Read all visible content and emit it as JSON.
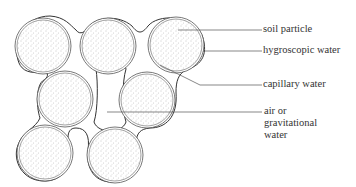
{
  "diagram": {
    "labels": [
      {
        "id": "soil-particle",
        "text": "soil particle",
        "x": 263,
        "y": 21
      },
      {
        "id": "hygroscopic-water",
        "text": "hygroscopic water",
        "x": 263,
        "y": 42
      },
      {
        "id": "capillary-water",
        "text": "capillary water",
        "x": 263,
        "y": 76
      },
      {
        "id": "air-gravitational-1",
        "text": "air or",
        "x": 264,
        "y": 103
      },
      {
        "id": "air-gravitational-2",
        "text": "gravitational",
        "x": 264,
        "y": 115
      },
      {
        "id": "air-gravitational-3",
        "text": "water",
        "x": 264,
        "y": 127
      }
    ],
    "particles": [
      {
        "cx": 43,
        "cy": 46,
        "r": 27
      },
      {
        "cx": 108,
        "cy": 46,
        "r": 27
      },
      {
        "cx": 176,
        "cy": 45,
        "r": 27
      },
      {
        "cx": 65,
        "cy": 99,
        "r": 27
      },
      {
        "cx": 147,
        "cy": 100,
        "r": 27
      },
      {
        "cx": 45,
        "cy": 153,
        "r": 27
      },
      {
        "cx": 115,
        "cy": 155,
        "r": 27
      }
    ],
    "colors": {
      "line": "#333333",
      "stipple": "#888888"
    }
  }
}
